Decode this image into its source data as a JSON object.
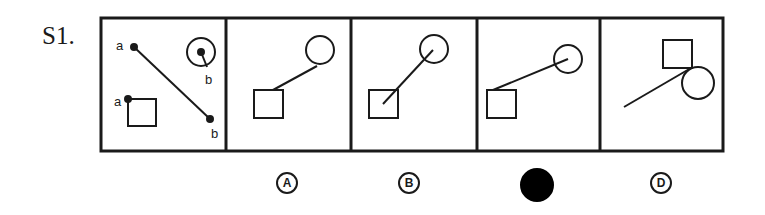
{
  "question": {
    "label": "S1.",
    "stem_labels": {
      "a1": "a",
      "b1": "b",
      "a2": "a",
      "b2": "b"
    },
    "options": [
      {
        "letter": "A",
        "selected": false
      },
      {
        "letter": "B",
        "selected": false
      },
      {
        "letter": "C",
        "selected": true
      },
      {
        "letter": "D",
        "selected": false
      }
    ]
  },
  "colors": {
    "ink": "#1a1a1a",
    "background": "#ffffff",
    "selected_fill": "#000000"
  }
}
